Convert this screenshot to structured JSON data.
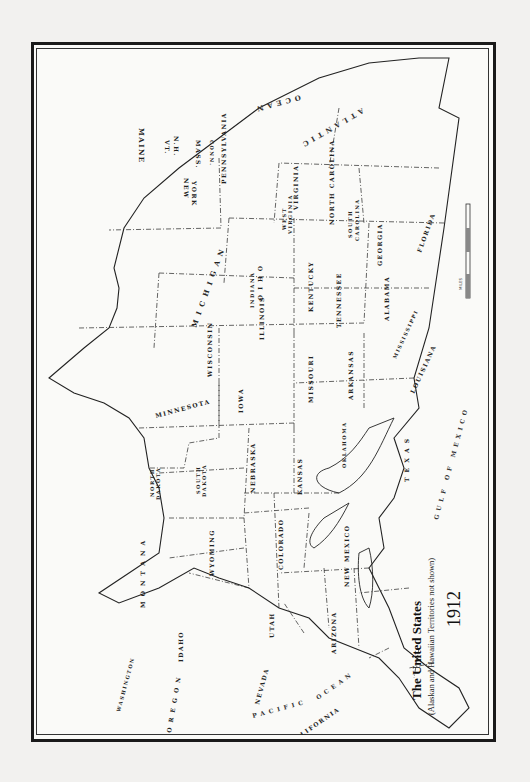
{
  "map": {
    "title": "The United States",
    "subtitle": "(Alaskan and Hawaiian Territories not shown)",
    "year": "1912",
    "orientation": "rotated 90° clockwise (north to the left)",
    "oceans": [
      "ATLANTIC OCEAN",
      "PACIFIC OCEAN",
      "GULF OF MEXICO"
    ],
    "scale_bar": {
      "label": "MILES",
      "ticks": [
        "0",
        "100",
        "200",
        "300",
        "400"
      ]
    },
    "states": [
      "MAINE",
      "VT.",
      "N.H.",
      "MASS.",
      "CONN.",
      "R.I.",
      "NEW YORK",
      "PENNSYLVANIA",
      "N.J.",
      "DEL.",
      "MD.",
      "VIRGINIA",
      "WEST VIRGINIA",
      "NORTH CAROLINA",
      "SOUTH CAROLINA",
      "GEORGIA",
      "FLORIDA",
      "OHIO",
      "MICHIGAN",
      "INDIANA",
      "ILLINOIS",
      "KENTUCKY",
      "TENNESSEE",
      "ALABAMA",
      "MISSISSIPPI",
      "WISCONSIN",
      "MINNESOTA",
      "IOWA",
      "MISSOURI",
      "ARKANSAS",
      "LOUISIANA",
      "NORTH DAKOTA",
      "SOUTH DAKOTA",
      "NEBRASKA",
      "KANSAS",
      "OKLAHOMA",
      "TEXAS",
      "MONTANA",
      "WYOMING",
      "COLORADO",
      "NEW MEXICO",
      "IDAHO",
      "UTAH",
      "ARIZONA",
      "WASHINGTON",
      "OREGON",
      "NEVADA",
      "CALIFORNIA"
    ]
  },
  "labels": {
    "maine": "MAINE",
    "vt": "VT.",
    "nh": "N.H.",
    "mass": "MASS.",
    "conn": "CONN.",
    "newyork1": "NEW",
    "newyork2": "YORK",
    "penn": "PENNSYLVANIA",
    "virginia": "VIRGINIA",
    "wv1": "WEST",
    "wv2": "VIRGINIA",
    "nc": "NORTH CAROLINA",
    "sc1": "SOUTH",
    "sc2": "CAROLINA",
    "georgia": "GEORGIA",
    "florida": "FLORIDA",
    "ohio": "O H I O",
    "michigan": "M I C H I G A N",
    "indiana": "INDIANA",
    "illinois": "ILLINOIS",
    "kentucky": "KENTUCKY",
    "tennessee": "TENNESSEE",
    "alabama": "ALABAMA",
    "mississippi": "MISSISSIPPI",
    "wisconsin": "WISCONSIN",
    "minnesota": "MINNESOTA",
    "iowa": "IOWA",
    "missouri": "MISSOURI",
    "arkansas": "ARKANSAS",
    "louisiana": "LOUISIANA",
    "nd1": "NORTH",
    "nd2": "DAKOTA",
    "sd1": "SOUTH",
    "sd2": "DAKOTA",
    "nebraska": "NEBRASKA",
    "kansas": "KANSAS",
    "oklahoma": "OKLAHOMA",
    "texas": "T E X A S",
    "montana": "M O N T A N A",
    "wyoming": "WYOMING",
    "colorado": "COLORADO",
    "newmexico": "NEW MEXICO",
    "idaho": "IDAHO",
    "utah": "UTAH",
    "arizona": "ARIZONA",
    "washington": "WASHINGTON",
    "oregon": "O R E G O N",
    "nevada": "NEVADA",
    "california": "CALIFORNIA",
    "atlantic": "ATLANTIC",
    "atlantic2": "OCEAN",
    "pacific": "PACIFIC",
    "pacific2": "OCEAN",
    "gulf": "GULF OF MEXICO",
    "miles": "MILES"
  }
}
